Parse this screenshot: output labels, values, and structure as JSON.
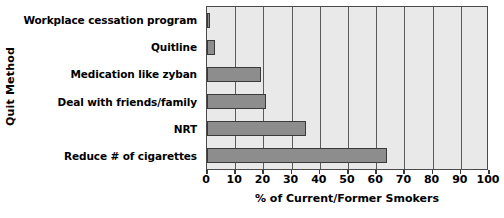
{
  "chart_data": {
    "type": "bar",
    "orientation": "horizontal",
    "title": "",
    "xlabel": "% of Current/Former Smokers",
    "ylabel": "Quit Method",
    "categories": [
      "Workplace cessation program",
      "Quitline",
      "Medication like zyban",
      "Deal with friends/family",
      "NRT",
      "Reduce # of cigarettes"
    ],
    "values": [
      1,
      3,
      19,
      21,
      35,
      64
    ],
    "xlim": [
      0,
      100
    ],
    "xticks": [
      0,
      10,
      20,
      30,
      40,
      50,
      60,
      70,
      80,
      90,
      100
    ],
    "xtick_labels": [
      "0",
      "10",
      "20",
      "30",
      "40",
      "50",
      "60",
      "70",
      "80",
      "90",
      "100"
    ],
    "grid": true,
    "grid_axis": "x",
    "legend": false,
    "colors": {
      "bar_fill": "#8d8d8d",
      "bar_edge": "#3a3a3a",
      "plot_background": "#e9e9e9",
      "plot_border": "#4a4a4a",
      "gridline": "#5a5a5a",
      "text": "#000000",
      "page_background": "#ffffff"
    }
  }
}
